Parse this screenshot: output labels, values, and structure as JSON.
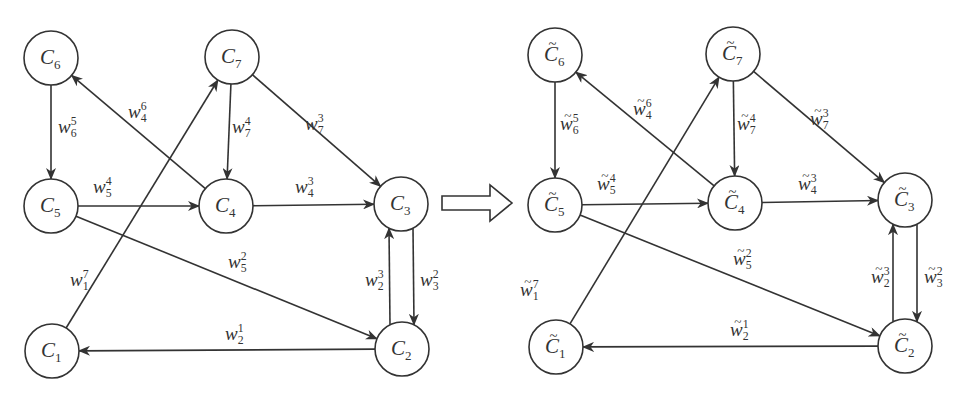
{
  "figure": {
    "transform_arrow": "⇒",
    "graphs": [
      {
        "id": "original",
        "node_symbol": "C",
        "weight_symbol": "w",
        "tilde": false,
        "nodes": [
          {
            "id": "1",
            "x": 52,
            "y": 351
          },
          {
            "id": "2",
            "x": 402,
            "y": 349
          },
          {
            "id": "3",
            "x": 401,
            "y": 204
          },
          {
            "id": "4",
            "x": 226,
            "y": 206
          },
          {
            "id": "5",
            "x": 51,
            "y": 206
          },
          {
            "id": "6",
            "x": 51,
            "y": 58
          },
          {
            "id": "7",
            "x": 232,
            "y": 57
          }
        ],
        "edges": [
          {
            "from": "6",
            "to": "5",
            "sub": "6",
            "sup": "5",
            "lx": 58,
            "ly": 133
          },
          {
            "from": "4",
            "to": "6",
            "sub": "4",
            "sup": "6",
            "lx": 128,
            "ly": 118
          },
          {
            "from": "7",
            "to": "4",
            "sub": "7",
            "sup": "4",
            "lx": 232,
            "ly": 133
          },
          {
            "from": "7",
            "to": "3",
            "sub": "7",
            "sup": "3",
            "lx": 305,
            "ly": 130
          },
          {
            "from": "5",
            "to": "4",
            "sub": "5",
            "sup": "4",
            "lx": 93,
            "ly": 193
          },
          {
            "from": "4",
            "to": "3",
            "sub": "4",
            "sup": "3",
            "lx": 295,
            "ly": 193
          },
          {
            "from": "1",
            "to": "7",
            "sub": "1",
            "sup": "7",
            "lx": 70,
            "ly": 286
          },
          {
            "from": "5",
            "to": "2",
            "sub": "5",
            "sup": "2",
            "lx": 228,
            "ly": 268
          },
          {
            "from": "2",
            "to": "3",
            "sub": "2",
            "sup": "3",
            "lx": 365,
            "ly": 286,
            "offset": -12
          },
          {
            "from": "3",
            "to": "2",
            "sub": "3",
            "sup": "2",
            "lx": 420,
            "ly": 286,
            "offset": 12
          },
          {
            "from": "2",
            "to": "1",
            "sub": "2",
            "sup": "1",
            "lx": 225,
            "ly": 340
          }
        ]
      },
      {
        "id": "transformed",
        "node_symbol": "C",
        "weight_symbol": "w",
        "tilde": true,
        "nodes": [
          {
            "id": "1",
            "x": 556,
            "y": 347
          },
          {
            "id": "2",
            "x": 905,
            "y": 346
          },
          {
            "id": "3",
            "x": 905,
            "y": 200
          },
          {
            "id": "4",
            "x": 735,
            "y": 203
          },
          {
            "id": "5",
            "x": 555,
            "y": 205
          },
          {
            "id": "6",
            "x": 555,
            "y": 55
          },
          {
            "id": "7",
            "x": 733,
            "y": 54
          }
        ],
        "edges": [
          {
            "from": "6",
            "to": "5",
            "sub": "6",
            "sup": "5",
            "lx": 560,
            "ly": 130
          },
          {
            "from": "4",
            "to": "6",
            "sub": "4",
            "sup": "6",
            "lx": 633,
            "ly": 115
          },
          {
            "from": "7",
            "to": "4",
            "sub": "7",
            "sup": "4",
            "lx": 737,
            "ly": 130
          },
          {
            "from": "7",
            "to": "3",
            "sub": "7",
            "sup": "3",
            "lx": 810,
            "ly": 125
          },
          {
            "from": "5",
            "to": "4",
            "sub": "5",
            "sup": "4",
            "lx": 597,
            "ly": 190
          },
          {
            "from": "4",
            "to": "3",
            "sub": "4",
            "sup": "3",
            "lx": 798,
            "ly": 190
          },
          {
            "from": "1",
            "to": "7",
            "sub": "1",
            "sup": "7",
            "lx": 520,
            "ly": 296
          },
          {
            "from": "5",
            "to": "2",
            "sub": "5",
            "sup": "2",
            "lx": 733,
            "ly": 265
          },
          {
            "from": "2",
            "to": "3",
            "sub": "2",
            "sup": "3",
            "lx": 871,
            "ly": 283,
            "offset": -12
          },
          {
            "from": "3",
            "to": "2",
            "sub": "3",
            "sup": "2",
            "lx": 924,
            "ly": 283,
            "offset": 12
          },
          {
            "from": "2",
            "to": "1",
            "sub": "2",
            "sup": "1",
            "lx": 730,
            "ly": 336
          }
        ]
      }
    ],
    "style": {
      "stroke": "#333333",
      "background": "#ffffff",
      "node_radius": 27
    }
  }
}
